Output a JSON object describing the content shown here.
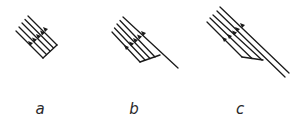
{
  "figure": {
    "panels": [
      {
        "id": "a",
        "label": "a",
        "label_pos": [
          40,
          103
        ]
      },
      {
        "id": "b",
        "label": "b",
        "label_pos": [
          134,
          103
        ]
      },
      {
        "id": "c",
        "label": "c",
        "label_pos": [
          240,
          103
        ]
      }
    ]
  },
  "colors": {
    "ink": "#1a1a1a",
    "background": "#ffffff"
  }
}
